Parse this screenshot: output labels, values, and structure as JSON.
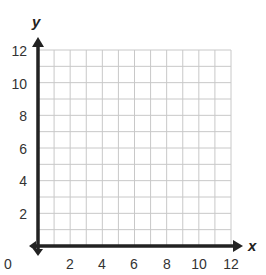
{
  "chart_data": {
    "type": "scatter",
    "title": "",
    "xlabel": "x",
    "ylabel": "y",
    "xlim": [
      0,
      12
    ],
    "ylim": [
      0,
      12
    ],
    "x_ticks": [
      2,
      4,
      6,
      8,
      10,
      12
    ],
    "y_ticks": [
      2,
      4,
      6,
      8,
      10,
      12
    ],
    "origin_label": "0",
    "grid": true,
    "grid_step": 1,
    "series": [],
    "colors": {
      "axis": "#222222",
      "grid": "#c8c8c8",
      "text": "#333333"
    }
  },
  "labels": {
    "x_axis": "x",
    "y_axis": "y",
    "origin": "0",
    "x_tick_2": "2",
    "x_tick_4": "4",
    "x_tick_6": "6",
    "x_tick_8": "8",
    "x_tick_10": "10",
    "x_tick_12": "12",
    "y_tick_2": "2",
    "y_tick_4": "4",
    "y_tick_6": "6",
    "y_tick_8": "8",
    "y_tick_10": "10",
    "y_tick_12": "12"
  }
}
